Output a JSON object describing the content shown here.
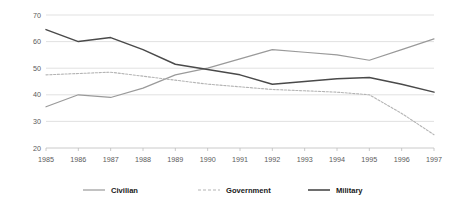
{
  "chart_data": {
    "type": "line",
    "title": "",
    "subtitle": "",
    "xlabel": "",
    "ylabel": "",
    "x": [
      1985,
      1986,
      1987,
      1988,
      1989,
      1990,
      1991,
      1992,
      1993,
      1994,
      1995,
      1996,
      1997
    ],
    "categories": [
      "1985",
      "1986",
      "1987",
      "1988",
      "1989",
      "1990",
      "1991",
      "1992",
      "1993",
      "1994",
      "1995",
      "1996",
      "1997"
    ],
    "xlim": [
      1985,
      1997
    ],
    "ylim": [
      20,
      70
    ],
    "yticks": [
      20,
      30,
      40,
      50,
      60,
      70
    ],
    "ytick_labels": [
      "20",
      "30",
      "40",
      "50",
      "60",
      "70"
    ],
    "grid": true,
    "grid_axis": "y",
    "legend_position": "bottom",
    "series": [
      {
        "name": "Civilian",
        "style": "solid",
        "color": "#9a9a9a",
        "values": [
          35.5,
          40.0,
          39.0,
          42.5,
          47.5,
          50.0,
          53.5,
          57.0,
          56.0,
          55.0,
          53.0,
          57.0,
          61.0
        ]
      },
      {
        "name": "Government",
        "style": "dashed",
        "color": "#b4b4b4",
        "values": [
          47.5,
          48.0,
          48.5,
          47.0,
          45.5,
          44.0,
          43.0,
          42.0,
          41.5,
          41.0,
          40.0,
          33.0,
          25.0
        ]
      },
      {
        "name": "Military",
        "style": "solid",
        "color": "#4a4a4a",
        "values": [
          64.5,
          60.0,
          61.5,
          57.0,
          51.5,
          49.5,
          47.5,
          44.0,
          45.0,
          46.0,
          46.5,
          44.0,
          41.0
        ]
      }
    ]
  },
  "legend": {
    "items": [
      {
        "label": "Civilian"
      },
      {
        "label": "Government"
      },
      {
        "label": "Military"
      }
    ]
  }
}
